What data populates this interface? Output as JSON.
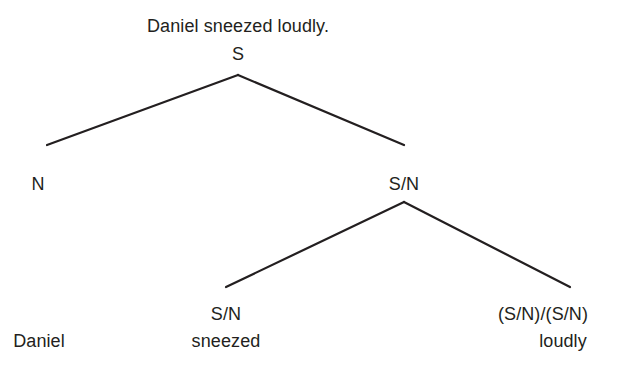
{
  "diagram": {
    "type": "categorial-grammar-derivation-tree",
    "sentence": "Daniel sneezed loudly.",
    "nodes": [
      {
        "id": "root",
        "category": "S",
        "x": 238,
        "y": 44
      },
      {
        "id": "n",
        "category": "N",
        "x": 38,
        "y": 174
      },
      {
        "id": "sn",
        "category": "S/N",
        "x": 404,
        "y": 174
      },
      {
        "id": "sn2",
        "category": "S/N",
        "x": 226,
        "y": 304
      },
      {
        "id": "adv",
        "category": "(S/N)/(S/N)",
        "x": 543,
        "y": 304
      }
    ],
    "words": [
      {
        "text": "Daniel",
        "x": 39,
        "y": 331
      },
      {
        "text": "sneezed",
        "x": 226,
        "y": 331
      },
      {
        "text": "loudly",
        "x": 563,
        "y": 331
      }
    ],
    "edges": [
      {
        "from": "root",
        "to": "n",
        "x1": 238,
        "y1": 75,
        "x2": 47,
        "y2": 145
      },
      {
        "from": "root",
        "to": "sn",
        "x1": 238,
        "y1": 75,
        "x2": 404,
        "y2": 145
      },
      {
        "from": "sn",
        "to": "sn2",
        "x1": 404,
        "y1": 202,
        "x2": 226,
        "y2": 287
      },
      {
        "from": "sn",
        "to": "adv",
        "x1": 404,
        "y1": 202,
        "x2": 570,
        "y2": 287
      }
    ],
    "line_color": "#231f20"
  }
}
